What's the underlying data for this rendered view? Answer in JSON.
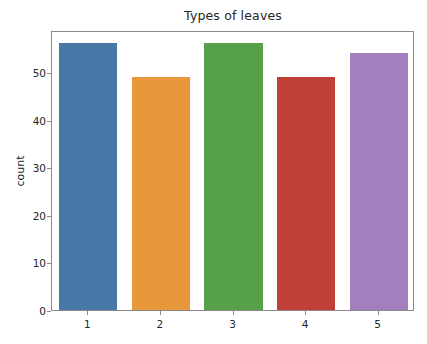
{
  "chart_data": {
    "type": "bar",
    "title": "Types of leaves",
    "xlabel": "",
    "ylabel": "count",
    "categories": [
      "1",
      "2",
      "3",
      "4",
      "5"
    ],
    "values": [
      56,
      49,
      56,
      49,
      54
    ],
    "ylim": [
      0,
      58.8
    ],
    "xlim": [
      -0.5,
      4.5
    ],
    "yticks": [
      0,
      10,
      20,
      30,
      40,
      50
    ],
    "ytick_labels": [
      "0",
      "10",
      "20",
      "30",
      "40",
      "50"
    ],
    "xtick_labels": [
      "1",
      "2",
      "3",
      "4",
      "5"
    ],
    "grid": false,
    "legend": null,
    "bar_colors": [
      "#4878a8",
      "#e8973c",
      "#55a048",
      "#c04038",
      "#a37fbe"
    ],
    "bar_width_fraction": 0.8,
    "axes_edge_color": "#8a8a8a",
    "background_color": "#ffffff",
    "text_color": "#262626"
  }
}
